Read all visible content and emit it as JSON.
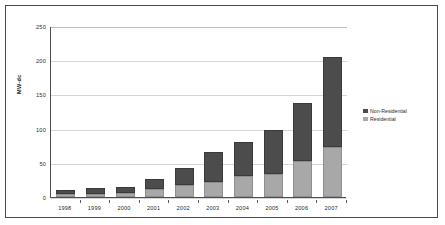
{
  "chart_data": {
    "type": "bar",
    "stacked": true,
    "title": "",
    "subtitle": "",
    "xlabel": "",
    "ylabel": "MW-dc",
    "ylim": [
      0,
      250
    ],
    "yticks": [
      0,
      50,
      100,
      150,
      200,
      250
    ],
    "grid": true,
    "legend_position": "right",
    "categories": [
      "1998",
      "1999",
      "2000",
      "2001",
      "2002",
      "2003",
      "2004",
      "2005",
      "2006",
      "2007"
    ],
    "series": [
      {
        "name": "Residential",
        "color": "#a8a8a8",
        "values": [
          4,
          5,
          6,
          11,
          18,
          22,
          31,
          34,
          52,
          73
        ]
      },
      {
        "name": "Non-Residential",
        "color": "#4c4c4c",
        "values": [
          6,
          8,
          9,
          15,
          24,
          44,
          49,
          64,
          86,
          132
        ]
      }
    ],
    "totals": [
      10,
      13,
      15,
      26,
      42,
      66,
      80,
      98,
      138,
      205
    ],
    "legend_order": [
      "Non-Residential",
      "Residential"
    ]
  },
  "colors": {
    "non_residential": "#4c4c4c",
    "residential": "#a8a8a8",
    "gridline": "#d6d6d6",
    "axis": "#4d4d4d",
    "frame": "#4a4a4a",
    "background": "#ffffff",
    "text": "#2b2b2b"
  }
}
